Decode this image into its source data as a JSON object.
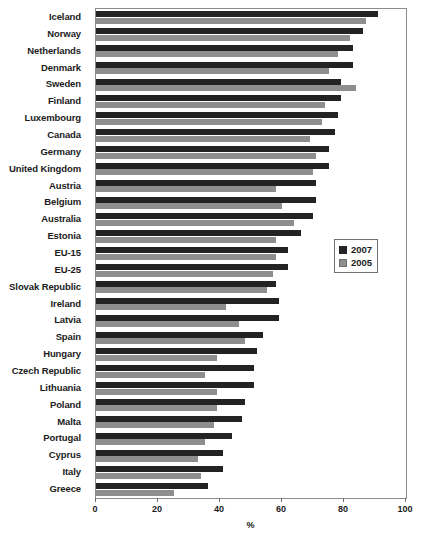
{
  "chart_data": {
    "type": "bar",
    "orientation": "horizontal",
    "title": "",
    "xlabel": "%",
    "ylabel": "",
    "xlim": [
      0,
      100
    ],
    "xticks": [
      0,
      20,
      40,
      60,
      80,
      100
    ],
    "grid": false,
    "legend_position": "right-middle",
    "categories": [
      "Iceland",
      "Norway",
      "Netherlands",
      "Denmark",
      "Sweden",
      "Finland",
      "Luxembourg",
      "Canada",
      "Germany",
      "United Kingdom",
      "Austria",
      "Belgium",
      "Australia",
      "Estonia",
      "EU-15",
      "EU-25",
      "Slovak Republic",
      "Ireland",
      "Latvia",
      "Spain",
      "Hungary",
      "Czech Republic",
      "Lithuania",
      "Poland",
      "Malta",
      "Portugal",
      "Cyprus",
      "Italy",
      "Greece"
    ],
    "series": [
      {
        "name": "2007",
        "color": "#232323",
        "values": [
          91,
          86,
          83,
          83,
          79,
          79,
          78,
          77,
          75,
          75,
          71,
          71,
          70,
          66,
          62,
          62,
          58,
          59,
          59,
          54,
          52,
          51,
          51,
          48,
          47,
          44,
          41,
          41,
          36
        ]
      },
      {
        "name": "2005",
        "color": "#8e8e8e",
        "values": [
          87,
          82,
          78,
          75,
          84,
          74,
          73,
          69,
          71,
          70,
          58,
          60,
          64,
          58,
          58,
          57,
          55,
          42,
          46,
          48,
          39,
          35,
          39,
          39,
          38,
          35,
          33,
          34,
          25
        ]
      }
    ]
  },
  "legend": {
    "entries": [
      {
        "label": "2007",
        "swatch": "dark-square-icon"
      },
      {
        "label": "2005",
        "swatch": "gray-square-icon"
      }
    ]
  },
  "axis": {
    "x_title": "%",
    "tick_labels": [
      "0",
      "20",
      "40",
      "60",
      "80",
      "100"
    ]
  }
}
